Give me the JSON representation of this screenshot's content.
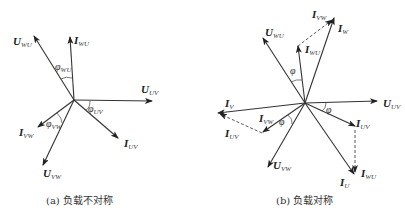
{
  "diagrams": [
    {
      "id": "a",
      "caption": "(a) 负载不对称",
      "vectors": [
        {
          "name": "U",
          "sub": "WU"
        },
        {
          "name": "I",
          "sub": "WU"
        },
        {
          "name": "U",
          "sub": "UV"
        },
        {
          "name": "I",
          "sub": "UV"
        },
        {
          "name": "I",
          "sub": "VW"
        },
        {
          "name": "U",
          "sub": "VW"
        }
      ],
      "angles": [
        {
          "symbol": "φ",
          "sub": "WU"
        },
        {
          "symbol": "φ",
          "sub": "UV"
        },
        {
          "symbol": "φ",
          "sub": "VW"
        }
      ]
    },
    {
      "id": "b",
      "caption": "(b) 负载对称",
      "vectors": [
        {
          "name": "U",
          "sub": "WU"
        },
        {
          "name": "I",
          "sub": "WU"
        },
        {
          "name": "I",
          "sub": "W"
        },
        {
          "name": "I",
          "sub": "VW"
        },
        {
          "name": "U",
          "sub": "UV"
        },
        {
          "name": "I",
          "sub": "UV"
        },
        {
          "name": "I",
          "sub": "U"
        },
        {
          "name": "I",
          "sub": "WU"
        },
        {
          "name": "I",
          "sub": "V"
        },
        {
          "name": "I",
          "sub": "VW"
        },
        {
          "name": "I",
          "sub": "UV"
        },
        {
          "name": "U",
          "sub": "VW"
        }
      ],
      "angles": [
        {
          "symbol": "φ",
          "sub": ""
        },
        {
          "symbol": "φ",
          "sub": ""
        },
        {
          "symbol": "φ",
          "sub": ""
        }
      ]
    }
  ]
}
